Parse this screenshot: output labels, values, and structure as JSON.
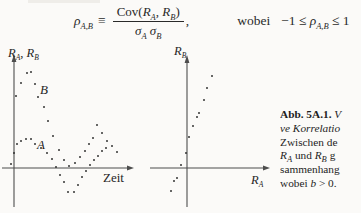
{
  "formula": {
    "lhs": {
      "symbol": "ρ",
      "sub": "A,B"
    },
    "relation": "≡",
    "numerator": {
      "func": "Cov(",
      "a": "R",
      "a_sub": "A",
      "comma": ", ",
      "b": "R",
      "b_sub": "B",
      "close": ")"
    },
    "denominator": {
      "s1": "σ",
      "s1_sub": "A",
      "s2": " σ",
      "s2_sub": "B"
    },
    "trailing_comma": ",",
    "connective": "wobei",
    "range": {
      "pre": "−1 ≤ ",
      "symbol": "ρ",
      "sub": "A,B",
      "post": " ≤ 1"
    }
  },
  "left_plot": {
    "y_axis_label": {
      "r1": "R",
      "r1_sub": "A",
      "sep": ", ",
      "r2": "R",
      "r2_sub": "B"
    },
    "x_axis_label": "Zeit",
    "series_b_label": "B",
    "series_a_label": "A"
  },
  "right_plot": {
    "y_axis_label": {
      "r": "R",
      "sub": "B"
    },
    "x_axis_label": {
      "r": "R",
      "sub": "A"
    }
  },
  "caption": {
    "label": "Abb. 5A.1.",
    "line1_rest": "V",
    "line2": "ve Korrelatio",
    "line3": "Zwischen de",
    "line4": {
      "r1": "R",
      "r1_sub": "A",
      "mid": " und ",
      "r2": "R",
      "r2_sub": "B",
      "end": " g"
    },
    "line5": "sammenhang",
    "line6": {
      "pre": "wobei ",
      "var": "b",
      "post": " > 0."
    }
  },
  "chart_data": [
    {
      "type": "scatter",
      "title": "",
      "xlabel": "Zeit",
      "ylabel": "R_A, R_B",
      "axes": "unscaled schematic axes, no ticks; x-axis crossed by dipping series",
      "legend": "labels A (lower series) and B (upper series) placed inline",
      "note": "points_px are local SVG pixel coordinates; x-axis line at y=130, y-axis line at x=14",
      "series": [
        {
          "name": "B",
          "points_px": [
            [
              16,
              58
            ],
            [
              21,
              45
            ],
            [
              27,
              35
            ],
            [
              31,
              34
            ],
            [
              35,
              46
            ],
            [
              38,
              59
            ],
            [
              44,
              69
            ],
            [
              48,
              83
            ],
            [
              53,
              98
            ],
            [
              59,
              112
            ],
            [
              64,
              122
            ],
            [
              69,
              128
            ],
            [
              75,
              125
            ],
            [
              80,
              119
            ],
            [
              85,
              113
            ],
            [
              89,
              106
            ],
            [
              93,
              100
            ],
            [
              97,
              87
            ],
            [
              102,
              95
            ],
            [
              107,
              103
            ],
            [
              112,
              108
            ],
            [
              117,
              114
            ]
          ]
        },
        {
          "name": "A",
          "points_px": [
            [
              11,
              126
            ],
            [
              14,
              115
            ],
            [
              17,
              106
            ],
            [
              21,
              103
            ],
            [
              26,
              101
            ],
            [
              31,
              101
            ],
            [
              35,
              106
            ],
            [
              41,
              110
            ],
            [
              47,
              115
            ],
            [
              52,
              121
            ],
            [
              56,
              129
            ],
            [
              60,
              137
            ],
            [
              64,
              144
            ],
            [
              68,
              154
            ],
            [
              74,
              154
            ],
            [
              78,
              147
            ],
            [
              82,
              139
            ],
            [
              86,
              133
            ],
            [
              90,
              127
            ],
            [
              94,
              122
            ],
            [
              98,
              118
            ],
            [
              102,
              113
            ],
            [
              106,
              110
            ]
          ]
        }
      ]
    },
    {
      "type": "scatter",
      "title": "",
      "xlabel": "R_A",
      "ylabel": "R_B",
      "axes": "unscaled schematic axes, no ticks; positive linear relation through origin region",
      "note": "points_px are local SVG pixel coordinates; x-axis line at y=130, y-axis line at x=44",
      "series": [
        {
          "name": "R_B vs R_A",
          "points_px": [
            [
              28,
              153
            ],
            [
              31,
              143
            ],
            [
              34,
              140
            ],
            [
              38,
              127
            ],
            [
              43,
              115
            ],
            [
              46,
              99
            ],
            [
              50,
              88
            ],
            [
              54,
              79
            ],
            [
              56,
              75
            ],
            [
              61,
              62
            ],
            [
              64,
              50
            ],
            [
              69,
              38
            ]
          ]
        }
      ]
    }
  ]
}
